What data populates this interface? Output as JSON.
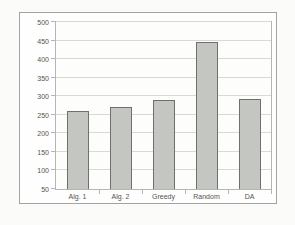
{
  "chart_data": {
    "type": "bar",
    "title": "",
    "xlabel": "",
    "ylabel": "",
    "categories": [
      "Alg. 1",
      "Alg. 2",
      "Greedy",
      "Random",
      "DA"
    ],
    "values": [
      260,
      272,
      290,
      447,
      292
    ],
    "ylim": [
      50,
      500
    ],
    "ytick_step": 50,
    "yticks": [
      50,
      100,
      150,
      200,
      250,
      300,
      350,
      400,
      450,
      500
    ],
    "grid": true,
    "legend": false,
    "legend_position": "none",
    "colors": {
      "bar_fill": "#c4c6c2",
      "bar_border": "#6f706e",
      "gridline": "#d8d8d4",
      "plot_border": "#b5b5b2",
      "frame_border": "#a3a3a0",
      "background": "#fbfbf9",
      "plot_background": "#fdfdfc",
      "tick_text": "#55544f"
    }
  }
}
